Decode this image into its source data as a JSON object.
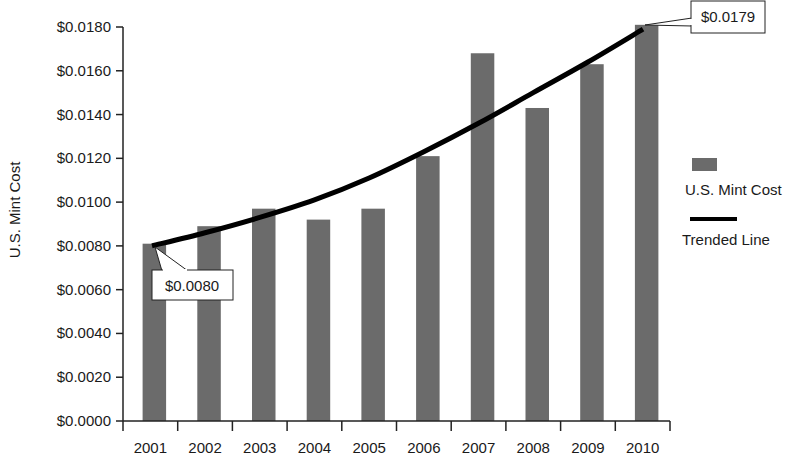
{
  "chart_data": {
    "type": "bar",
    "title": "",
    "xlabel": "",
    "ylabel": "U.S. Mint Cost",
    "ylim": [
      0,
      0.018
    ],
    "yticks": [
      "$0.0000",
      "$0.0020",
      "$0.0040",
      "$0.0060",
      "$0.0080",
      "$0.0100",
      "$0.0120",
      "$0.0140",
      "$0.0160",
      "$0.0180"
    ],
    "categories": [
      "2001",
      "2002",
      "2003",
      "2004",
      "2005",
      "2006",
      "2007",
      "2008",
      "2009",
      "2010"
    ],
    "series": [
      {
        "name": "U.S. Mint Cost",
        "type": "bar",
        "color": "#6b6b6b",
        "values": [
          0.0081,
          0.0089,
          0.0097,
          0.0092,
          0.0097,
          0.0121,
          0.0168,
          0.0143,
          0.0163,
          0.0181
        ]
      },
      {
        "name": "Trended Line",
        "type": "line",
        "color": "#000000",
        "values": [
          0.008,
          0.0086,
          0.0093,
          0.0101,
          0.0111,
          0.0123,
          0.0136,
          0.015,
          0.0164,
          0.0179
        ]
      }
    ],
    "annotations": [
      {
        "text": "$0.0080",
        "category": "2001",
        "series": "Trended Line"
      },
      {
        "text": "$0.0179",
        "category": "2010",
        "series": "Trended Line"
      }
    ],
    "legend": {
      "position": "right",
      "entries": [
        "U.S. Mint Cost",
        "Trended Line"
      ]
    },
    "grid": false
  },
  "labels": {
    "ylabel": "U.S. Mint Cost",
    "legend_bar": "U.S. Mint Cost",
    "legend_line": "Trended Line",
    "callout_start": "$0.0080",
    "callout_end": "$0.0179"
  }
}
